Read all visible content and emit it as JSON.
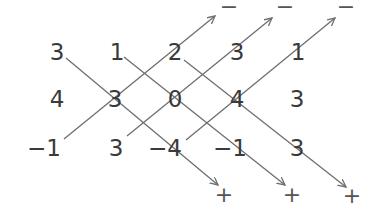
{
  "matrix": {
    "rows": [
      [
        "3",
        "1",
        "2",
        "3",
        "1"
      ],
      [
        "4",
        "3",
        "0",
        "4",
        "3"
      ],
      [
        "−1",
        "3",
        "−4",
        "−1",
        "3"
      ]
    ]
  },
  "signs": {
    "minus": [
      "−",
      "−",
      "−"
    ],
    "plus": [
      "+",
      "+",
      "+"
    ]
  },
  "colors": {
    "line": "#6e6e6e",
    "text": "#3a3a3a"
  }
}
